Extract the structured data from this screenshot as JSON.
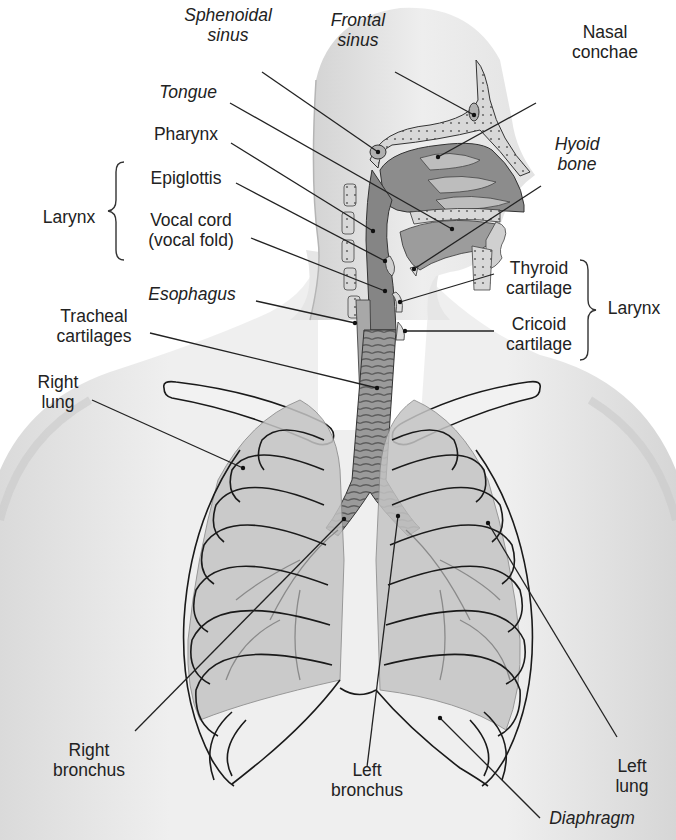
{
  "figure": {
    "colors": {
      "skin": "#e9e9e9",
      "skin_shadow": "#cfcfcf",
      "airway": "#8f8f8f",
      "airway_light": "#b9b9b9",
      "lung": "#c8c8c8",
      "outline": "#1a1a1a",
      "leader": "#222222",
      "text": "#222222"
    }
  },
  "labels": [
    {
      "id": "sphenoidal-sinus",
      "text": "Sphenoidal\nsinus",
      "italic": true,
      "x": 178,
      "y": 5,
      "w": 100,
      "align": "center",
      "line": [
        [
          262,
          72
        ],
        [
          378,
          152
        ]
      ]
    },
    {
      "id": "frontal-sinus",
      "text": "Frontal\nsinus",
      "italic": true,
      "x": 318,
      "y": 10,
      "w": 80,
      "align": "center",
      "line": [
        [
          395,
          72
        ],
        [
          474,
          115
        ]
      ]
    },
    {
      "id": "nasal-conchae",
      "text": "Nasal\nconchae",
      "italic": false,
      "x": 560,
      "y": 22,
      "w": 90,
      "align": "center",
      "line": [
        [
          536,
          103
        ],
        [
          438,
          157
        ]
      ]
    },
    {
      "id": "tongue",
      "text": "Tongue",
      "italic": true,
      "x": 150,
      "y": 82,
      "w": 76,
      "align": "center",
      "line": [
        [
          230,
          103
        ],
        [
          452,
          229
        ]
      ]
    },
    {
      "id": "hyoid-bone",
      "text": "Hyoid\nbone",
      "italic": true,
      "x": 542,
      "y": 134,
      "w": 70,
      "align": "center",
      "line": [
        [
          541,
          186
        ],
        [
          414,
          269
        ]
      ]
    },
    {
      "id": "pharynx",
      "text": "Pharynx",
      "italic": false,
      "x": 146,
      "y": 124,
      "w": 80,
      "align": "center",
      "line": [
        [
          231,
          143
        ],
        [
          373,
          231
        ]
      ]
    },
    {
      "id": "epiglottis",
      "text": "Epiglottis",
      "italic": false,
      "x": 141,
      "y": 168,
      "w": 90,
      "align": "center",
      "line": [
        [
          236,
          183
        ],
        [
          385,
          261
        ]
      ]
    },
    {
      "id": "vocal-cord",
      "text": "Vocal cord\n(vocal fold)",
      "italic": false,
      "x": 140,
      "y": 210,
      "w": 102,
      "align": "center",
      "line": [
        [
          251,
          238
        ],
        [
          385,
          291
        ]
      ]
    },
    {
      "id": "larynx-left",
      "text": "Larynx",
      "italic": false,
      "x": 36,
      "y": 207,
      "w": 66,
      "align": "center",
      "line": null
    },
    {
      "id": "esophagus",
      "text": "Esophagus",
      "italic": true,
      "x": 142,
      "y": 284,
      "w": 100,
      "align": "center",
      "line": [
        [
          256,
          301
        ],
        [
          355,
          323
        ]
      ]
    },
    {
      "id": "tracheal-cartilages",
      "text": "Tracheal\ncartilages",
      "italic": false,
      "x": 46,
      "y": 306,
      "w": 96,
      "align": "center",
      "line": [
        [
          150,
          333
        ],
        [
          377,
          388
        ]
      ]
    },
    {
      "id": "thyroid-cartilage",
      "text": "Thyroid\ncartilage",
      "italic": false,
      "x": 497,
      "y": 258,
      "w": 84,
      "align": "center",
      "line": [
        [
          494,
          274
        ],
        [
          400,
          302
        ]
      ]
    },
    {
      "id": "cricoid-cartilage",
      "text": "Cricoid\ncartilage",
      "italic": false,
      "x": 497,
      "y": 314,
      "w": 84,
      "align": "center",
      "line": [
        [
          494,
          331
        ],
        [
          405,
          331
        ]
      ]
    },
    {
      "id": "larynx-right",
      "text": "Larynx",
      "italic": false,
      "x": 601,
      "y": 298,
      "w": 66,
      "align": "center",
      "line": null
    },
    {
      "id": "right-lung",
      "text": "Right\nlung",
      "italic": false,
      "x": 28,
      "y": 372,
      "w": 60,
      "align": "center",
      "line": [
        [
          92,
          400
        ],
        [
          243,
          468
        ]
      ]
    },
    {
      "id": "right-bronchus",
      "text": "Right\nbronchus",
      "italic": false,
      "x": 44,
      "y": 740,
      "w": 90,
      "align": "center",
      "line": [
        [
          135,
          731
        ],
        [
          344,
          519
        ]
      ]
    },
    {
      "id": "left-bronchus",
      "text": "Left\nbronchus",
      "italic": false,
      "x": 322,
      "y": 760,
      "w": 90,
      "align": "center",
      "line": [
        [
          367,
          767
        ],
        [
          398,
          516
        ]
      ]
    },
    {
      "id": "left-lung",
      "text": "Left\nlung",
      "italic": false,
      "x": 604,
      "y": 756,
      "w": 56,
      "align": "center",
      "line": [
        [
          617,
          737
        ],
        [
          488,
          523
        ]
      ]
    },
    {
      "id": "diaphragm",
      "text": "Diaphragm",
      "italic": true,
      "x": 540,
      "y": 808,
      "w": 104,
      "align": "center",
      "line": [
        [
          540,
          818
        ],
        [
          440,
          718
        ]
      ]
    }
  ],
  "braces": [
    {
      "id": "larynx-left-brace",
      "x": 104,
      "y": 160,
      "h": 100,
      "dir": "left"
    },
    {
      "id": "larynx-right-brace",
      "x": 582,
      "y": 258,
      "h": 100,
      "dir": "right"
    }
  ]
}
